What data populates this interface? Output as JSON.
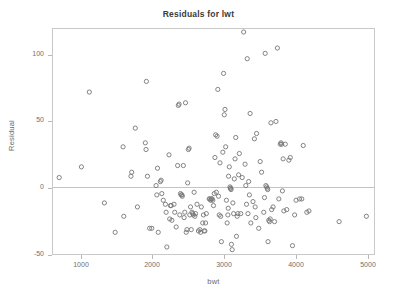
{
  "chart_data": {
    "type": "scatter",
    "title": "Residuals for lwt",
    "xlabel": "bwt",
    "ylabel": "Residual",
    "xlim": [
      600,
      5100
    ],
    "ylim": [
      -50,
      120
    ],
    "grid": false,
    "legend": null,
    "reference_line": {
      "orientation": "horizontal",
      "value": 0
    },
    "xticks": [
      1000,
      2000,
      3000,
      4000,
      5000
    ],
    "xtick_labels": [
      "1000",
      "2000",
      "3000",
      "4000",
      "5000"
    ],
    "yticks": [
      -50,
      0,
      50,
      100
    ],
    "ytick_labels": [
      "-50",
      "0",
      "50",
      "100"
    ],
    "marker": "open-circle",
    "marker_color": "#767676",
    "series": [
      {
        "name": "residuals",
        "points": [
          [
            700,
            8
          ],
          [
            1010,
            16
          ],
          [
            1120,
            72
          ],
          [
            1330,
            -11
          ],
          [
            1480,
            -33
          ],
          [
            1590,
            31
          ],
          [
            1600,
            -21
          ],
          [
            1700,
            9
          ],
          [
            1710,
            12
          ],
          [
            1760,
            45
          ],
          [
            1790,
            -14
          ],
          [
            1900,
            34
          ],
          [
            1910,
            29
          ],
          [
            1915,
            80
          ],
          [
            1930,
            9
          ],
          [
            1960,
            -30
          ],
          [
            1990,
            -30
          ],
          [
            2050,
            2
          ],
          [
            2060,
            -5
          ],
          [
            2070,
            15
          ],
          [
            2080,
            -33
          ],
          [
            2110,
            5
          ],
          [
            2120,
            6
          ],
          [
            2130,
            -4
          ],
          [
            2150,
            -9
          ],
          [
            2180,
            -12
          ],
          [
            2190,
            -18
          ],
          [
            2200,
            -44
          ],
          [
            2230,
            25
          ],
          [
            2240,
            -23
          ],
          [
            2250,
            -13
          ],
          [
            2260,
            -13
          ],
          [
            2270,
            -24
          ],
          [
            2300,
            -12
          ],
          [
            2310,
            -18
          ],
          [
            2330,
            -29
          ],
          [
            2350,
            17
          ],
          [
            2360,
            62
          ],
          [
            2370,
            63
          ],
          [
            2380,
            -20
          ],
          [
            2390,
            -4
          ],
          [
            2400,
            -5
          ],
          [
            2410,
            -5
          ],
          [
            2415,
            -6
          ],
          [
            2430,
            17
          ],
          [
            2440,
            -22
          ],
          [
            2450,
            -18
          ],
          [
            2460,
            64
          ],
          [
            2470,
            -33
          ],
          [
            2480,
            -31
          ],
          [
            2490,
            4
          ],
          [
            2500,
            29
          ],
          [
            2510,
            30
          ],
          [
            2520,
            -20
          ],
          [
            2530,
            -14
          ],
          [
            2540,
            -31
          ],
          [
            2550,
            -18
          ],
          [
            2560,
            -19
          ],
          [
            2570,
            -20
          ],
          [
            2580,
            -3
          ],
          [
            2590,
            -21
          ],
          [
            2600,
            -19
          ],
          [
            2620,
            -12
          ],
          [
            2640,
            -32
          ],
          [
            2660,
            -31
          ],
          [
            2670,
            -33
          ],
          [
            2680,
            -14
          ],
          [
            2700,
            -26
          ],
          [
            2710,
            -20
          ],
          [
            2720,
            -32
          ],
          [
            2730,
            -32
          ],
          [
            2740,
            -26
          ],
          [
            2750,
            -19
          ],
          [
            2790,
            -8
          ],
          [
            2800,
            -8
          ],
          [
            2810,
            -9
          ],
          [
            2820,
            -8
          ],
          [
            2830,
            -8
          ],
          [
            2840,
            -9
          ],
          [
            2850,
            -13
          ],
          [
            2860,
            -4
          ],
          [
            2870,
            23
          ],
          [
            2880,
            40
          ],
          [
            2890,
            -3
          ],
          [
            2900,
            39
          ],
          [
            2910,
            74
          ],
          [
            2920,
            -6
          ],
          [
            2930,
            -20
          ],
          [
            2940,
            19
          ],
          [
            2950,
            -21
          ],
          [
            2960,
            -40
          ],
          [
            2980,
            27
          ],
          [
            2990,
            86
          ],
          [
            3000,
            55
          ],
          [
            3010,
            59
          ],
          [
            3020,
            31
          ],
          [
            3030,
            -9
          ],
          [
            3040,
            -26
          ],
          [
            3050,
            -20
          ],
          [
            3055,
            -15
          ],
          [
            3060,
            9
          ],
          [
            3070,
            16
          ],
          [
            3080,
            1
          ],
          [
            3085,
            0
          ],
          [
            3090,
            0
          ],
          [
            3095,
            -1
          ],
          [
            3100,
            -42
          ],
          [
            3110,
            -46
          ],
          [
            3120,
            -11
          ],
          [
            3130,
            -19
          ],
          [
            3140,
            7
          ],
          [
            3150,
            22
          ],
          [
            3160,
            38
          ],
          [
            3170,
            -36
          ],
          [
            3180,
            -21
          ],
          [
            3190,
            -19
          ],
          [
            3200,
            10
          ],
          [
            3210,
            26
          ],
          [
            3230,
            -19
          ],
          [
            3250,
            8
          ],
          [
            3270,
            117
          ],
          [
            3290,
            18
          ],
          [
            3300,
            2
          ],
          [
            3310,
            -12
          ],
          [
            3320,
            97
          ],
          [
            3330,
            -19
          ],
          [
            3340,
            5
          ],
          [
            3350,
            -5
          ],
          [
            3360,
            56
          ],
          [
            3370,
            -26
          ],
          [
            3400,
            -10
          ],
          [
            3420,
            37
          ],
          [
            3430,
            -14
          ],
          [
            3440,
            -22
          ],
          [
            3450,
            41
          ],
          [
            3480,
            -30
          ],
          [
            3500,
            20
          ],
          [
            3520,
            12
          ],
          [
            3550,
            -18
          ],
          [
            3560,
            -7
          ],
          [
            3570,
            101
          ],
          [
            3580,
            2
          ],
          [
            3590,
            1
          ],
          [
            3600,
            0
          ],
          [
            3605,
            -1
          ],
          [
            3610,
            -40
          ],
          [
            3620,
            -24
          ],
          [
            3630,
            -25
          ],
          [
            3640,
            -23
          ],
          [
            3650,
            49
          ],
          [
            3660,
            -16
          ],
          [
            3680,
            -14
          ],
          [
            3700,
            -25
          ],
          [
            3720,
            50
          ],
          [
            3740,
            105
          ],
          [
            3760,
            -8
          ],
          [
            3780,
            33
          ],
          [
            3790,
            34
          ],
          [
            3800,
            33
          ],
          [
            3810,
            -2
          ],
          [
            3820,
            22
          ],
          [
            3830,
            -17
          ],
          [
            3850,
            33
          ],
          [
            3870,
            -16
          ],
          [
            3900,
            21
          ],
          [
            3920,
            23
          ],
          [
            3950,
            -43
          ],
          [
            3980,
            -20
          ],
          [
            4000,
            -9
          ],
          [
            4050,
            -8
          ],
          [
            4080,
            -8
          ],
          [
            4100,
            32
          ],
          [
            4150,
            -18
          ],
          [
            4180,
            -17
          ],
          [
            4600,
            -25
          ],
          [
            4980,
            -21
          ]
        ]
      }
    ]
  },
  "axes": {
    "title": "Residuals for lwt",
    "x_label": "bwt",
    "y_label": "Residual"
  }
}
